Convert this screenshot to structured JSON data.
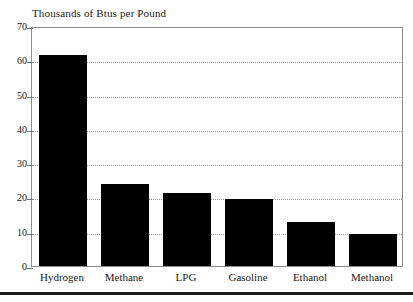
{
  "figure": {
    "name": "bar-chart-figure",
    "bottom_rule": true
  },
  "chart_data": {
    "type": "bar",
    "title": "Thousands of Btus per Pound",
    "subtitle": "",
    "xlabel": "",
    "ylabel": "",
    "categories": [
      "Hydrogen",
      "Methane",
      "LPG",
      "Gasoline",
      "Ethanol",
      "Methanol"
    ],
    "values": [
      61.5,
      24.0,
      21.4,
      19.5,
      12.7,
      9.3
    ],
    "ylim": [
      0,
      70
    ],
    "ytick_values": [
      0,
      10,
      20,
      30,
      40,
      50,
      60,
      70
    ],
    "ytick_labels": [
      "0",
      "10",
      "20",
      "30",
      "40",
      "50",
      "60",
      "70"
    ],
    "gridlines": {
      "horizontal": true,
      "vertical": false,
      "style": "dotted",
      "at_values": [
        10,
        20,
        30,
        40,
        50,
        60
      ]
    },
    "legend": {
      "visible": false,
      "position": "none",
      "entries": []
    },
    "bar_color": "#000000",
    "plot_border_color": "#8c8c8c",
    "grid_color": "#9a9a9a",
    "background_color": "#ffffff",
    "annotations": []
  }
}
